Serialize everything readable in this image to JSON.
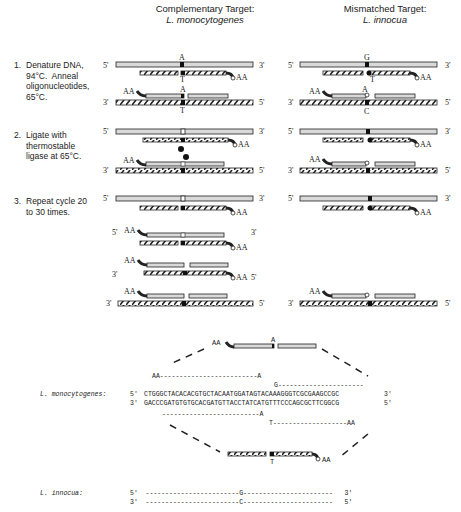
{
  "headers": {
    "left": {
      "title": "Complementary Target:",
      "species": "L. monocytogenes"
    },
    "right": {
      "title": "Mismatched Target:",
      "species": "L. innocua"
    }
  },
  "steps": [
    {
      "num": "1.",
      "text": "Denature DNA,\n94°C.  Anneal\noligonucleotides,\n65°C."
    },
    {
      "num": "2.",
      "text": "Ligate with\nthermostable\nligase at 65°C."
    },
    {
      "num": "3.",
      "text": "Repeat cycle 20\nto 30 times."
    }
  ],
  "labels": {
    "five": "5'",
    "three": "3'",
    "aa": "AA",
    "base_A": "A",
    "base_T": "T",
    "base_G": "G",
    "base_C": "C"
  },
  "sequence": {
    "organism_1": "L. monocytogenes:",
    "organism_2": "L. innocua:",
    "top_prefix": "5'",
    "top_strand": "CTGGGCTACACACGTGCTACAATGGATAGTACAAAGGGTCGCGAAGCCGC",
    "top_suffix": "3'",
    "bottom_prefix": "3'",
    "bottom_strand": "GACCCGATGTGTGCACGATGTTACCTATCATGTTTCCCAGCGCTTCGGCG",
    "bottom_suffix": "5'",
    "probe_upper_left": "AA-------------------------A",
    "probe_upper_right": "G----------------------",
    "probe_lower_left": "-------------------------A",
    "probe_lower_right": "T-------------------AA",
    "innocua_top": "5'  ------------------------G-----------------------   3'",
    "innocua_bottom": "3'  ------------------------C-----------------------   5'"
  },
  "colors": {
    "template_fill": "#d9d9d9",
    "stroke": "#222222",
    "junction": "#111111"
  }
}
